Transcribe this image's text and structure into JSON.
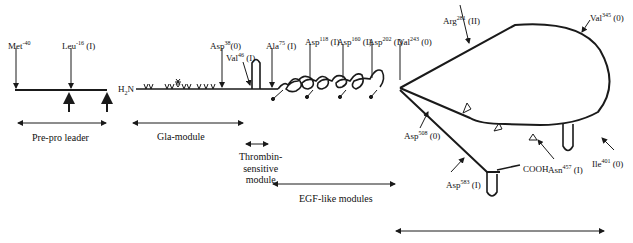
{
  "figure": {
    "n_terminus": "H2N",
    "n_terminus_sub": "2",
    "c_terminus": "COOH"
  },
  "sites": [
    {
      "id": "met",
      "residue": "Met",
      "position": "-40",
      "cleavage": ""
    },
    {
      "id": "leu",
      "residue": "Leu",
      "position": "-16",
      "cleavage": "(I)"
    },
    {
      "id": "asp38",
      "residue": "Asp",
      "position": "38",
      "cleavage": "(0)"
    },
    {
      "id": "val46",
      "residue": "Val",
      "position": "46",
      "cleavage": "(I)"
    },
    {
      "id": "ala75",
      "residue": "Ala",
      "position": "75",
      "cleavage": "(I)"
    },
    {
      "id": "asp118",
      "residue": "Asp",
      "position": "118",
      "cleavage": "(I)"
    },
    {
      "id": "asp160",
      "residue": "Asp",
      "position": "160",
      "cleavage": "(I)"
    },
    {
      "id": "asp202",
      "residue": "Asp",
      "position": "202",
      "cleavage": "(I)"
    },
    {
      "id": "val243",
      "residue": "Val",
      "position": "243",
      "cleavage": "(0)"
    },
    {
      "id": "arg281",
      "residue": "Arg",
      "position": "281",
      "cleavage": "(II)"
    },
    {
      "id": "val345",
      "residue": "Val",
      "position": "345",
      "cleavage": "(0)"
    },
    {
      "id": "asp508",
      "residue": "Asp",
      "position": "508",
      "cleavage": "(0)"
    },
    {
      "id": "asp583",
      "residue": "Asp",
      "position": "583",
      "cleavage": "(I)"
    },
    {
      "id": "asn457",
      "residue": "Asn",
      "position": "457",
      "cleavage": "(I)"
    },
    {
      "id": "ile401",
      "residue": "Ile",
      "position": "401",
      "cleavage": "(0)"
    }
  ],
  "modules": [
    {
      "id": "prepro",
      "label": "Pre-pro leader"
    },
    {
      "id": "gla",
      "label": "Gla-module"
    },
    {
      "id": "thrombin",
      "label": "Thrombin-\nsensitive\nmodule"
    },
    {
      "id": "egf",
      "label": "EGF-like modules"
    },
    {
      "id": "shbg",
      "label": ""
    }
  ],
  "colors": {
    "ink": "#1a1a1a",
    "background": "#ffffff"
  }
}
